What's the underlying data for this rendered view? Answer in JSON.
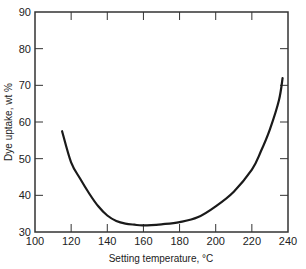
{
  "chart_data": {
    "type": "line",
    "title": "",
    "xlabel": "Setting temperature, °C",
    "ylabel": "Dye uptake, wt %",
    "xlim": [
      100,
      240
    ],
    "ylim": [
      30,
      90
    ],
    "xticks": [
      100,
      120,
      140,
      160,
      180,
      200,
      220,
      240
    ],
    "yticks": [
      30,
      40,
      50,
      60,
      70,
      80,
      90
    ],
    "grid": false,
    "legend": null,
    "series": [
      {
        "name": "Dye uptake",
        "x": [
          115,
          120,
          125,
          130,
          135,
          140,
          145,
          150,
          155,
          160,
          170,
          180,
          190,
          200,
          210,
          220,
          225,
          230,
          235,
          237
        ],
        "y": [
          57.5,
          49,
          44.5,
          40.5,
          37,
          34.5,
          33,
          32.3,
          32,
          31.8,
          32.1,
          32.7,
          34,
          37,
          41,
          47,
          52,
          58,
          66,
          72
        ]
      }
    ],
    "colors": {
      "line": "#1a1a1a",
      "axis": "#333333"
    }
  }
}
